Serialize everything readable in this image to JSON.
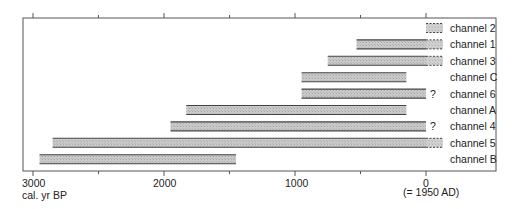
{
  "chart_data": {
    "type": "bar",
    "orientation": "horizontal-range",
    "title": "",
    "xlabel": "cal. yr BP",
    "xlabel_note": "(= 1950 AD)",
    "ylabel": "",
    "xlim": [
      3080,
      -150
    ],
    "x_ticks": [
      3000,
      2500,
      2000,
      1500,
      1000,
      500,
      0
    ],
    "x_tick_labels": {
      "3000": "3000",
      "2000": "2000",
      "1000": "1000",
      "0": "0"
    },
    "grid": false,
    "legend": null,
    "series": [
      {
        "name": "channel 2",
        "start": 0,
        "end": 0,
        "dashed_extension_to": -130,
        "uncertain": false
      },
      {
        "name": "channel 1",
        "start": 530,
        "end": 0,
        "dashed_extension_to": -130,
        "uncertain": false
      },
      {
        "name": "channel 3",
        "start": 750,
        "end": 0,
        "dashed_extension_to": -130,
        "uncertain": false
      },
      {
        "name": "channel C",
        "start": 950,
        "end": 150,
        "dashed_extension_to": null,
        "uncertain": false
      },
      {
        "name": "channel 6",
        "start": 950,
        "end": 0,
        "dashed_extension_to": null,
        "uncertain": true
      },
      {
        "name": "channel A",
        "start": 1830,
        "end": 150,
        "dashed_extension_to": null,
        "uncertain": false
      },
      {
        "name": "channel 4",
        "start": 1950,
        "end": 0,
        "dashed_extension_to": null,
        "uncertain": true
      },
      {
        "name": "channel 5",
        "start": 2850,
        "end": 0,
        "dashed_extension_to": -130,
        "uncertain": false
      },
      {
        "name": "channel B",
        "start": 2950,
        "end": 1450,
        "dashed_extension_to": null,
        "uncertain": false
      }
    ],
    "annotations": [
      "?"
    ]
  },
  "axis": {
    "tick_3000": "3000",
    "tick_2000": "2000",
    "tick_1000": "1000",
    "tick_0": "0",
    "unit": "cal. yr BP",
    "note": "(= 1950 AD)"
  },
  "colors": {
    "bar_fill": "#c4c4c4",
    "bar_edge": "#444444",
    "frame": "#555555"
  }
}
